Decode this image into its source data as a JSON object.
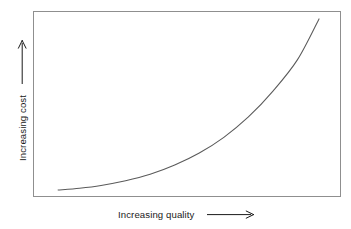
{
  "chart_data": {
    "type": "line",
    "title": "",
    "subtitle": "",
    "xlabel": "Increasing quality",
    "ylabel": "Increasing cost",
    "xlabel_arrow": "⟶",
    "ylabel_arrow": "⟶",
    "grid": false,
    "legend": null,
    "axis_ticks": false,
    "tick_labels": [],
    "annotations": [],
    "xlim": [
      0,
      1
    ],
    "ylim": [
      0,
      1
    ],
    "series": [
      {
        "name": "cost vs quality",
        "description": "Monotonically increasing convex (exponential-like) curve rising from a near-flat start at low quality to a steep climb at high quality.",
        "x": [
          0.08,
          0.15,
          0.22,
          0.3,
          0.38,
          0.46,
          0.54,
          0.62,
          0.7,
          0.78,
          0.86,
          0.93
        ],
        "y": [
          0.035,
          0.045,
          0.06,
          0.085,
          0.12,
          0.17,
          0.235,
          0.32,
          0.43,
          0.57,
          0.74,
          0.96
        ]
      }
    ],
    "colors": {
      "curve": "#5a5a5a",
      "frame": "#8f8f8f",
      "text": "#1a1a1a",
      "background": "#ffffff"
    }
  },
  "plot_frame": {
    "label": "plot area border"
  }
}
